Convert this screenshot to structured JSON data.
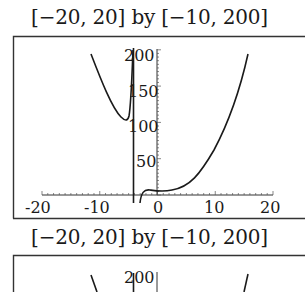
{
  "chart_data": [
    {
      "type": "line",
      "title": "[−20, 20] by [−10, 200]",
      "xlabel": "",
      "ylabel": "",
      "xlim": [
        -20,
        20
      ],
      "ylim": [
        -10,
        200
      ],
      "grid": false,
      "legend": null,
      "x_ticks": [
        "-20",
        "-10",
        "0",
        "10",
        "20"
      ],
      "y_ticks": [
        "50",
        "100",
        "150",
        "200"
      ],
      "annotations": [
        "vertical asymptote near x = -4"
      ],
      "series": [
        {
          "name": "left branch",
          "x": [
            -10.5,
            -9,
            -8,
            -7,
            -6,
            -5.2,
            -4.7,
            -4.3
          ],
          "y": [
            192,
            160,
            137,
            118,
            104,
            98,
            110,
            200
          ]
        },
        {
          "name": "right branch",
          "x": [
            -3.8,
            -3.5,
            -3,
            -2,
            -1,
            0,
            1,
            2,
            4,
            6,
            8,
            10,
            12,
            14,
            16
          ],
          "y": [
            -10,
            -2,
            3,
            6,
            6,
            5,
            5,
            6,
            14,
            30,
            52,
            82,
            118,
            158,
            200
          ]
        }
      ]
    },
    {
      "type": "line",
      "title": "[−20, 20] by [−10, 200]",
      "xlim": [
        -20,
        20
      ],
      "ylim": [
        -10,
        200
      ],
      "y_ticks": [
        "200"
      ],
      "note": "second panel, cropped at bottom of view"
    }
  ],
  "captions": {
    "top": "[−20, 20] by [−10, 200]",
    "bottom": "[−20, 20] by [−10, 200]"
  },
  "ticks": {
    "x": [
      "-20",
      "-10",
      "0",
      "10",
      "20"
    ],
    "y": [
      "50",
      "100",
      "150",
      "200"
    ],
    "y2": [
      "200"
    ]
  }
}
